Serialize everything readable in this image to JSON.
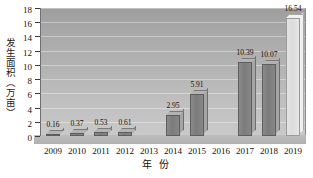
{
  "chart_data": {
    "type": "bar",
    "title": "",
    "xlabel": "年 份",
    "ylabel": "发生面积（万亩）",
    "categories": [
      "2009",
      "2010",
      "2011",
      "2012",
      "2013",
      "2014",
      "2015",
      "2016",
      "2017",
      "2018",
      "2019"
    ],
    "values": [
      0.16,
      0.37,
      0.53,
      0.61,
      null,
      2.95,
      5.91,
      null,
      10.39,
      10.07,
      16.54
    ],
    "value_labels": [
      "0.16",
      "0.37",
      "0.53",
      "0.61",
      "",
      "2.95",
      "5.91",
      "",
      "10.39",
      "10.07",
      "16.54"
    ],
    "bar_styles": [
      "dark",
      "dark",
      "dark",
      "dark",
      "none",
      "dark",
      "dark",
      "none",
      "dark",
      "dark",
      "light"
    ],
    "ylim": [
      0,
      18
    ],
    "yticks": [
      0,
      2,
      4,
      6,
      8,
      10,
      12,
      14,
      16,
      18
    ],
    "ytick_labels": [
      "0",
      "2",
      "4",
      "6",
      "8",
      "10",
      "12",
      "14",
      "16",
      "18"
    ],
    "grid": true,
    "legend": "none",
    "three_d": true,
    "colors": {
      "bar_dark": "#7c7c7c",
      "bar_light": "#dcdcdc",
      "plot_background": "#b4b4b4",
      "axis": "#3a3a3a",
      "text": "#101010"
    }
  }
}
